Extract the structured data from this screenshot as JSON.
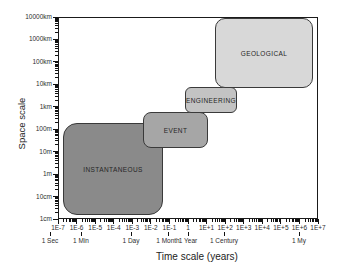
{
  "chart_data": {
    "type": "other",
    "subtype": "log-log nested region diagram (space scale vs time scale)",
    "x_axis": {
      "title": "Time scale (years)",
      "scale": "log",
      "range_years": [
        "1E-7",
        "1E+7"
      ],
      "tick_labels": [
        "1E-7",
        "1E-6",
        "1E-5",
        "1E-4",
        "1E-3",
        "1E-2",
        "1E-1",
        "1",
        "1E+1",
        "1E+2",
        "1E+3",
        "1E+4",
        "1E+5",
        "1E+6",
        "1E+7"
      ],
      "time_markers": [
        {
          "label": "1 Sec",
          "px": 50
        },
        {
          "label": "1 Min",
          "px": 81
        },
        {
          "label": "1 Day",
          "px": 131
        },
        {
          "label": "1 Month",
          "px": 168
        },
        {
          "label": "1 Year",
          "px": 188
        },
        {
          "label": "1 Century",
          "px": 224
        },
        {
          "label": "1 My",
          "px": 299
        }
      ]
    },
    "y_axis": {
      "title": "Space scale",
      "scale": "log",
      "range": [
        "1cm",
        "10000km"
      ],
      "tick_labels_bottom_to_top": [
        "1cm",
        "10cm",
        "1m",
        "10m",
        "100m",
        "1km",
        "10km",
        "100km",
        "1000km",
        "10000km"
      ]
    },
    "regions": [
      {
        "label": "INSTANTANEOUS",
        "time_range_years": [
          "2E-7",
          "2E-2"
        ],
        "space_range": [
          "1.5cm",
          "200m"
        ],
        "fill": "#8a8a8a",
        "px": {
          "left": 63,
          "top": 123,
          "width": 100,
          "height": 92,
          "radius": 14
        }
      },
      {
        "label": "EVENT",
        "time_range_years": [
          "4E-3",
          "1E+1"
        ],
        "space_range": [
          "15m",
          "600m"
        ],
        "fill": "#a6a6a6",
        "px": {
          "left": 143,
          "top": 112,
          "width": 65,
          "height": 36,
          "radius": 8
        }
      },
      {
        "label": "ENGINEERING",
        "time_range_years": [
          "7E-1",
          "4E+2"
        ],
        "space_range": [
          "500m",
          "6km"
        ],
        "fill": "#c3c3c3",
        "px": {
          "left": 185,
          "top": 87,
          "width": 52,
          "height": 26,
          "radius": 6
        }
      },
      {
        "label": "GEOLOGICAL",
        "time_range_years": [
          "3E+1",
          "5E+6"
        ],
        "space_range": [
          "7km",
          "9000km"
        ],
        "fill": "#d8d8d8",
        "px": {
          "left": 215,
          "top": 18,
          "width": 98,
          "height": 70,
          "radius": 10
        }
      }
    ],
    "layout": {
      "plot_px": {
        "left": 58,
        "top": 17,
        "right": 318,
        "bottom": 219
      },
      "x_decades": 14,
      "y_decades": 9,
      "border_color": "#1a1a1a",
      "region_border_color": "#3a3a3a",
      "background": "#ffffff",
      "grid": false,
      "legend": "none"
    }
  }
}
